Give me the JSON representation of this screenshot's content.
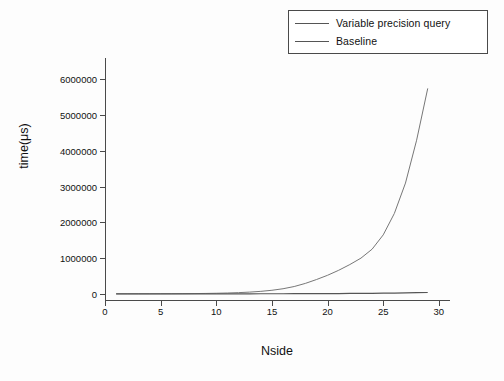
{
  "legend": {
    "entries": [
      {
        "label": "Variable precision query",
        "color": "#555555"
      },
      {
        "label": "Baseline",
        "color": "#777777"
      }
    ]
  },
  "axes": {
    "x_title": "Nside",
    "y_title": "time(μs)",
    "x_ticks": [
      "0",
      "5",
      "10",
      "15",
      "20",
      "25",
      "30"
    ],
    "y_ticks": [
      "0",
      "1000000",
      "2000000",
      "3000000",
      "4000000",
      "5000000",
      "6000000"
    ]
  },
  "chart_data": {
    "type": "line",
    "title": "",
    "xlabel": "Nside",
    "ylabel": "time(μs)",
    "xlim": [
      0,
      31
    ],
    "ylim": [
      -200000,
      6600000
    ],
    "grid": false,
    "legend_position": "top-right",
    "x": [
      1,
      2,
      3,
      4,
      5,
      6,
      7,
      8,
      9,
      10,
      11,
      12,
      13,
      14,
      15,
      16,
      17,
      18,
      19,
      20,
      21,
      22,
      23,
      24,
      25,
      26,
      27,
      28,
      29
    ],
    "series": [
      {
        "name": "Variable precision query",
        "color": "#555555",
        "values": [
          200,
          250,
          300,
          350,
          420,
          500,
          600,
          700,
          850,
          1000,
          1200,
          1500,
          1800,
          2200,
          2700,
          3300,
          4000,
          5000,
          6000,
          7500,
          9000,
          11000,
          13000,
          16000,
          19000,
          23000,
          27000,
          32000,
          38000
        ]
      },
      {
        "name": "Baseline",
        "color": "#777777",
        "values": [
          500,
          800,
          1200,
          1800,
          2600,
          3800,
          5500,
          8000,
          11500,
          16500,
          24000,
          34000,
          49000,
          70000,
          100000,
          143000,
          205000,
          292000,
          400000,
          520000,
          660000,
          820000,
          1000000,
          1250000,
          1650000,
          2250000,
          3100000,
          4300000,
          5750000
        ]
      }
    ]
  }
}
